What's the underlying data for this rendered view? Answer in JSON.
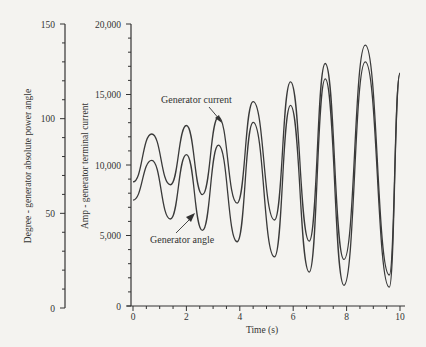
{
  "chart_data": {
    "type": "line",
    "title": "",
    "xlabel": "Time (s)",
    "ylabel_left": "Degree - generator absolute power angle",
    "ylabel_right": "Amp - generator terminal current",
    "xlim": [
      0,
      10
    ],
    "ylim_left": [
      0,
      150
    ],
    "ylim_right": [
      0,
      20000
    ],
    "x_ticks": [
      "0",
      "2",
      "4",
      "6",
      "8",
      "10"
    ],
    "y_left_ticks": [
      "0",
      "50",
      "100",
      "150"
    ],
    "y_right_ticks": [
      "0",
      "5,000",
      "10,000",
      "15,000",
      "20,000"
    ],
    "grid": false,
    "legend": "none (inline annotations with arrows)",
    "annotations": [
      "Generator current",
      "Generator angle"
    ],
    "series": [
      {
        "name": "Generator current",
        "axis": "right",
        "points": [
          [
            0.0,
            8800
          ],
          [
            0.7,
            12200
          ],
          [
            1.4,
            8600
          ],
          [
            2.0,
            12800
          ],
          [
            2.6,
            7900
          ],
          [
            3.2,
            13400
          ],
          [
            3.9,
            7300
          ],
          [
            4.5,
            14500
          ],
          [
            5.3,
            6100
          ],
          [
            5.9,
            15900
          ],
          [
            6.6,
            4600
          ],
          [
            7.2,
            17200
          ],
          [
            7.9,
            3300
          ],
          [
            8.7,
            18500
          ],
          [
            9.6,
            2200
          ],
          [
            10.0,
            16500
          ]
        ]
      },
      {
        "name": "Generator angle",
        "axis": "left",
        "points": [
          [
            0.0,
            57
          ],
          [
            0.7,
            78
          ],
          [
            1.4,
            47
          ],
          [
            2.0,
            81
          ],
          [
            2.6,
            41
          ],
          [
            3.2,
            86
          ],
          [
            3.9,
            35
          ],
          [
            4.5,
            98
          ],
          [
            5.3,
            27
          ],
          [
            5.9,
            107
          ],
          [
            6.6,
            19
          ],
          [
            7.2,
            121
          ],
          [
            7.9,
            12
          ],
          [
            8.7,
            130
          ],
          [
            9.6,
            11
          ],
          [
            10.0,
            124
          ]
        ]
      }
    ]
  },
  "annotations": {
    "current_label": "Generator current",
    "angle_label": "Generator angle"
  },
  "axes": {
    "xlabel": "Time (s)",
    "ylabel_left": "Degree - generator absolute power angle",
    "ylabel_right": "Amp - generator terminal current",
    "x_ticks": [
      "0",
      "2",
      "4",
      "6",
      "8",
      "10"
    ],
    "y_left_ticks": [
      "0",
      "50",
      "100",
      "150"
    ],
    "y_right_ticks": [
      "0",
      "5,000",
      "10,000",
      "15,000",
      "20,000"
    ]
  }
}
